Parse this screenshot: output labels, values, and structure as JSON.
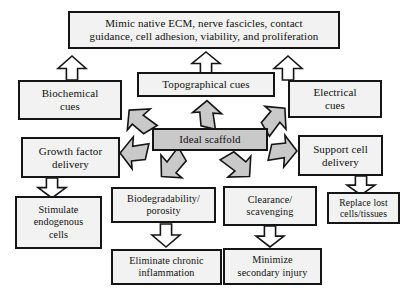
{
  "diagram": {
    "colors": {
      "box_fill": "#f2f2f2",
      "center_fill": "#c9c9c9",
      "stroke": "#151515",
      "hollow_arrow_fill": "#ffffff",
      "gray_arrow_fill": "#c9c9c9",
      "text": "#101010",
      "background": "#ffffff"
    },
    "nodes": [
      {
        "id": "mimic-ecm",
        "label": "Mimic native ECM, nerve fascicles, contact\nguidance, cell adhesion, viability, and proliferation",
        "x": 68,
        "y": 11,
        "w": 272,
        "h": 38,
        "size": "fs11",
        "style": "light"
      },
      {
        "id": "biochemical-cues",
        "label": "Biochemical\ncues",
        "x": 18,
        "y": 80,
        "w": 104,
        "h": 40,
        "size": "fs11",
        "style": "light"
      },
      {
        "id": "topographical-cues",
        "label": "Topographical cues",
        "x": 137,
        "y": 72,
        "w": 138,
        "h": 25,
        "size": "fs11",
        "style": "light"
      },
      {
        "id": "electrical-cues",
        "label": "Electrical\ncues",
        "x": 288,
        "y": 80,
        "w": 94,
        "h": 38,
        "size": "fs11",
        "style": "light"
      },
      {
        "id": "ideal-scaffold",
        "label": "Ideal scaffold",
        "x": 152,
        "y": 128,
        "w": 116,
        "h": 23,
        "size": "fs11",
        "style": "center"
      },
      {
        "id": "growth-factor-delivery",
        "label": "Growth factor\ndelivery",
        "x": 21,
        "y": 137,
        "w": 99,
        "h": 41,
        "size": "fs11",
        "style": "light"
      },
      {
        "id": "support-cell-delivery",
        "label": "Support cell\ndelivery",
        "x": 298,
        "y": 135,
        "w": 85,
        "h": 41,
        "size": "fs11",
        "style": "light"
      },
      {
        "id": "stimulate-endogenous-cells",
        "label": "Stimulate\nendogenous\ncells",
        "x": 15,
        "y": 196,
        "w": 87,
        "h": 53,
        "size": "fs10",
        "style": "light"
      },
      {
        "id": "biodegradability-porosity",
        "label": "Biodegradability/\nporosity",
        "x": 111,
        "y": 187,
        "w": 105,
        "h": 36,
        "size": "fs10",
        "style": "light"
      },
      {
        "id": "clearance-scavenging",
        "label": "Clearance/\nscavenging",
        "x": 223,
        "y": 186,
        "w": 94,
        "h": 40,
        "size": "fs10",
        "style": "light"
      },
      {
        "id": "replace-lost-cells-tissues",
        "label": "Replace lost\ncells/tissues",
        "x": 327,
        "y": 192,
        "w": 73,
        "h": 32,
        "size": "fs95",
        "style": "light"
      },
      {
        "id": "eliminate-chronic-inflammation",
        "label": "Eliminate chronic\ninflammation",
        "x": 111,
        "y": 249,
        "w": 111,
        "h": 36,
        "size": "fs10",
        "style": "light"
      },
      {
        "id": "minimize-secondary-injury",
        "label": "Minimize\nsecondary injury",
        "x": 223,
        "y": 248,
        "w": 99,
        "h": 37,
        "size": "fs10",
        "style": "light"
      }
    ],
    "arrows": [
      {
        "id": "biochemical-to-mimic",
        "kind": "hollow-up",
        "x": 58,
        "y": 56,
        "w": 28,
        "h": 24
      },
      {
        "id": "topographical-to-mimic",
        "kind": "hollow-up",
        "x": 192,
        "y": 52,
        "w": 28,
        "h": 22
      },
      {
        "id": "electrical-to-mimic",
        "kind": "hollow-up",
        "x": 274,
        "y": 56,
        "w": 28,
        "h": 24
      },
      {
        "id": "growth-to-stimulate",
        "kind": "hollow-down",
        "x": 38,
        "y": 178,
        "w": 28,
        "h": 20
      },
      {
        "id": "support-to-replace",
        "kind": "hollow-down",
        "x": 347,
        "y": 176,
        "w": 28,
        "h": 19
      },
      {
        "id": "biodegradability-to-eliminate",
        "kind": "hollow-down",
        "x": 152,
        "y": 224,
        "w": 28,
        "h": 23
      },
      {
        "id": "clearance-to-minimize",
        "kind": "hollow-down",
        "x": 256,
        "y": 226,
        "w": 28,
        "h": 21
      },
      {
        "id": "scaffold-to-topographical",
        "kind": "gray-up",
        "x": 192,
        "y": 100,
        "w": 30,
        "h": 30
      },
      {
        "id": "scaffold-to-biochemical",
        "kind": "gray-upleft",
        "x": 124,
        "y": 105,
        "w": 32,
        "h": 32
      },
      {
        "id": "scaffold-to-electrical",
        "kind": "gray-upright",
        "x": 258,
        "y": 103,
        "w": 32,
        "h": 32
      },
      {
        "id": "scaffold-to-growth",
        "kind": "gray-left",
        "x": 118,
        "y": 138,
        "w": 33,
        "h": 30
      },
      {
        "id": "scaffold-to-support",
        "kind": "gray-right",
        "x": 266,
        "y": 136,
        "w": 33,
        "h": 30
      },
      {
        "id": "scaffold-to-biodegradability",
        "kind": "gray-downleft",
        "x": 157,
        "y": 148,
        "w": 32,
        "h": 34
      },
      {
        "id": "scaffold-to-clearance",
        "kind": "gray-downright",
        "x": 222,
        "y": 148,
        "w": 32,
        "h": 34
      }
    ]
  }
}
